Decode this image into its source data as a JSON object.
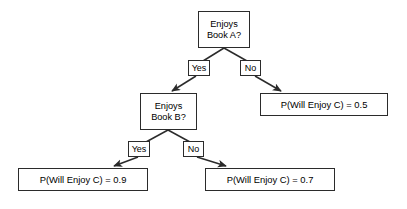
{
  "diagram": {
    "type": "decision-tree",
    "colors": {
      "background": "#ffffff",
      "stroke": "#2b2b2b",
      "text": "#000000"
    },
    "nodes": {
      "root": {
        "line1": "Enjoys",
        "line2": "Book A?",
        "x": 198,
        "y": 11,
        "w": 52,
        "h": 37
      },
      "second": {
        "line1": "Enjoys",
        "line2": "Book B?",
        "x": 140,
        "y": 93,
        "w": 57,
        "h": 37
      },
      "leaf_no_a": {
        "text": "P(Will Enjoy C) = 0.5",
        "x": 260,
        "y": 93,
        "w": 128,
        "h": 23
      },
      "leaf_yes_b": {
        "text": "P(Will Enjoy C) = 0.9",
        "x": 18,
        "y": 168,
        "w": 130,
        "h": 23
      },
      "leaf_no_b": {
        "text": "P(Will Enjoy C) = 0.7",
        "x": 205,
        "y": 168,
        "w": 130,
        "h": 23
      }
    },
    "edge_labels": {
      "root_yes": {
        "text": "Yes",
        "x": 188,
        "y": 60,
        "w": 22,
        "h": 16
      },
      "root_no": {
        "text": "No",
        "x": 240,
        "y": 60,
        "w": 21,
        "h": 16
      },
      "second_yes": {
        "text": "Yes",
        "x": 128,
        "y": 141,
        "w": 22,
        "h": 16
      },
      "second_no": {
        "text": "No",
        "x": 183,
        "y": 141,
        "w": 21,
        "h": 16
      }
    },
    "edges": [
      {
        "from": "root",
        "to": "second",
        "label": "Yes"
      },
      {
        "from": "root",
        "to": "leaf_no_a",
        "label": "No"
      },
      {
        "from": "second",
        "to": "leaf_yes_b",
        "label": "Yes"
      },
      {
        "from": "second",
        "to": "leaf_no_b",
        "label": "No"
      }
    ]
  }
}
